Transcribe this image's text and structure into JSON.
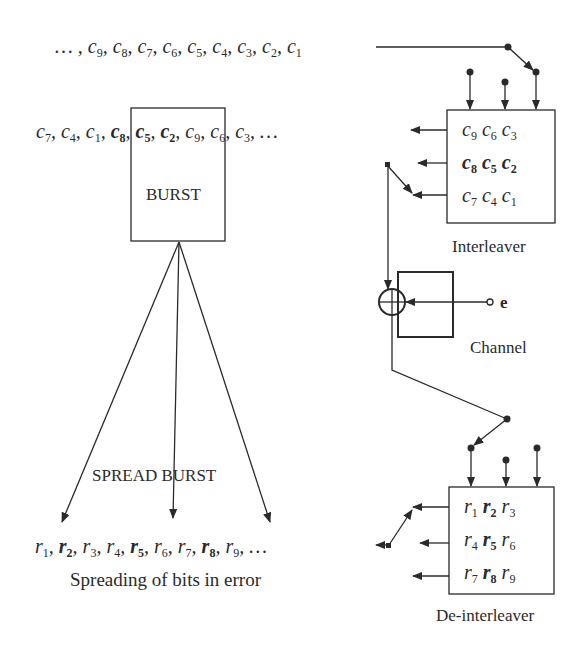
{
  "input_sequence": {
    "prefix": "… ,",
    "items": [
      {
        "sym": "c",
        "sub": "9",
        "bold": false
      },
      {
        "sym": "c",
        "sub": "8",
        "bold": false
      },
      {
        "sym": "c",
        "sub": "7",
        "bold": false
      },
      {
        "sym": "c",
        "sub": "6",
        "bold": false
      },
      {
        "sym": "c",
        "sub": "5",
        "bold": false
      },
      {
        "sym": "c",
        "sub": "4",
        "bold": false
      },
      {
        "sym": "c",
        "sub": "3",
        "bold": false
      },
      {
        "sym": "c",
        "sub": "2",
        "bold": false
      },
      {
        "sym": "c",
        "sub": "1",
        "bold": false
      }
    ]
  },
  "interleaved_sequence": {
    "items": [
      {
        "sym": "c",
        "sub": "7",
        "bold": false
      },
      {
        "sym": "c",
        "sub": "4",
        "bold": false
      },
      {
        "sym": "c",
        "sub": "1",
        "bold": false
      },
      {
        "sym": "c",
        "sub": "8",
        "bold": true
      },
      {
        "sym": "c",
        "sub": "5",
        "bold": true
      },
      {
        "sym": "c",
        "sub": "2",
        "bold": true
      },
      {
        "sym": "c",
        "sub": "9",
        "bold": false
      },
      {
        "sym": "c",
        "sub": "6",
        "bold": false
      },
      {
        "sym": "c",
        "sub": "3",
        "bold": false
      }
    ],
    "suffix": "…"
  },
  "burst_box": {
    "label": "BURST"
  },
  "interleaver": {
    "label": "Interleaver",
    "rows": [
      [
        {
          "sym": "c",
          "sub": "9",
          "bold": false
        },
        {
          "sym": "c",
          "sub": "6",
          "bold": false
        },
        {
          "sym": "c",
          "sub": "3",
          "bold": false
        }
      ],
      [
        {
          "sym": "c",
          "sub": "8",
          "bold": true
        },
        {
          "sym": "c",
          "sub": "5",
          "bold": true
        },
        {
          "sym": "c",
          "sub": "2",
          "bold": true
        }
      ],
      [
        {
          "sym": "c",
          "sub": "7",
          "bold": false
        },
        {
          "sym": "c",
          "sub": "4",
          "bold": false
        },
        {
          "sym": "c",
          "sub": "1",
          "bold": false
        }
      ]
    ]
  },
  "channel": {
    "label": "Channel",
    "error_input": "e"
  },
  "deinterleaver": {
    "label": "De-interleaver",
    "rows": [
      [
        {
          "sym": "r",
          "sub": "1",
          "bold": false
        },
        {
          "sym": "r",
          "sub": "2",
          "bold": true
        },
        {
          "sym": "r",
          "sub": "3",
          "bold": false
        }
      ],
      [
        {
          "sym": "r",
          "sub": "4",
          "bold": false
        },
        {
          "sym": "r",
          "sub": "5",
          "bold": true
        },
        {
          "sym": "r",
          "sub": "6",
          "bold": false
        }
      ],
      [
        {
          "sym": "r",
          "sub": "7",
          "bold": false
        },
        {
          "sym": "r",
          "sub": "8",
          "bold": true
        },
        {
          "sym": "r",
          "sub": "9",
          "bold": false
        }
      ]
    ]
  },
  "output_sequence": {
    "items": [
      {
        "sym": "r",
        "sub": "1",
        "bold": false
      },
      {
        "sym": "r",
        "sub": "2",
        "bold": true
      },
      {
        "sym": "r",
        "sub": "3",
        "bold": false
      },
      {
        "sym": "r",
        "sub": "4",
        "bold": false
      },
      {
        "sym": "r",
        "sub": "5",
        "bold": true
      },
      {
        "sym": "r",
        "sub": "6",
        "bold": false
      },
      {
        "sym": "r",
        "sub": "7",
        "bold": false
      },
      {
        "sym": "r",
        "sub": "8",
        "bold": true
      },
      {
        "sym": "r",
        "sub": "9",
        "bold": false
      }
    ],
    "suffix": "…"
  },
  "spread_label": "SPREAD BURST",
  "caption": "Spreading of bits in error",
  "colors": {
    "stroke": "#2a2a2a",
    "background": "#ffffff"
  }
}
